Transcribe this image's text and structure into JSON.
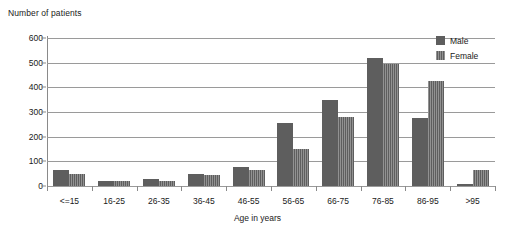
{
  "chart_data": {
    "type": "bar",
    "title": "",
    "ylabel": "Number of patients",
    "xlabel": "Age in years",
    "categories": [
      "<=15",
      "16-25",
      "26-35",
      "36-45",
      "46-55",
      "56-65",
      "66-75",
      "76-85",
      "86-95",
      ">95"
    ],
    "series": [
      {
        "name": "Male",
        "color": "#5e5e5e",
        "values": [
          65,
          20,
          30,
          48,
          78,
          255,
          350,
          520,
          275,
          10
        ]
      },
      {
        "name": "Female",
        "color": "#5e5e5e",
        "values": [
          48,
          20,
          22,
          45,
          65,
          150,
          280,
          495,
          425,
          65
        ]
      }
    ],
    "ylim": [
      0,
      600
    ],
    "ytick_labels": [
      "600",
      "500",
      "400",
      "300",
      "200",
      "100",
      "0"
    ],
    "ytick_values": [
      600,
      500,
      400,
      300,
      200,
      100,
      0
    ],
    "grid": true,
    "grid_axis": "y",
    "legend_position": "top-right"
  },
  "legend": {
    "items": [
      {
        "label": "Male",
        "pattern": "solid"
      },
      {
        "label": "Female",
        "pattern": "vertical-hatch"
      }
    ]
  }
}
